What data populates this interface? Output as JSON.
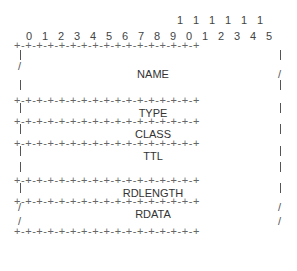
{
  "diagram": {
    "bit_ruler": {
      "tens_row": [
        "",
        "",
        "",
        "",
        "",
        "",
        "",
        "",
        "",
        "",
        "1",
        "1",
        "1",
        "1",
        "1",
        "1"
      ],
      "units_row": [
        "0",
        "1",
        "2",
        "3",
        "4",
        "5",
        "6",
        "7",
        "8",
        "9",
        "0",
        "1",
        "2",
        "3",
        "4",
        "5"
      ]
    },
    "separator": "+-+-+-+-+-+-+-+-+-+-+-+-+-+-+-+-+",
    "fields": [
      {
        "name": "NAME",
        "variable_length": true
      },
      {
        "name": "TYPE",
        "variable_length": false
      },
      {
        "name": "CLASS",
        "variable_length": false
      },
      {
        "name": "TTL",
        "variable_length": false
      },
      {
        "name": "RDLENGTH",
        "variable_length": false
      },
      {
        "name": "RDATA",
        "variable_length": true
      }
    ],
    "edges": {
      "pipe": "|",
      "slash": "/"
    }
  }
}
